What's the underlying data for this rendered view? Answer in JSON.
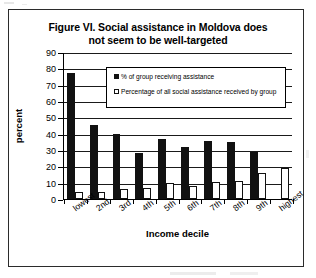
{
  "chart_data": {
    "type": "bar",
    "title": "Figure VI. Social assistance in Moldova does not seem to be well-targeted",
    "title_line1": "Figure VI. Social assistance in Moldova does",
    "title_line2": "not seem to be well-targeted",
    "xlabel": "Income decile",
    "ylabel": "percent",
    "ylim": [
      0,
      90
    ],
    "ytick_step": 10,
    "yticks": [
      0,
      10,
      20,
      30,
      40,
      50,
      60,
      70,
      80,
      90
    ],
    "grid": true,
    "legend_position": "inside-upper-center",
    "categories": [
      "lowest",
      "2nd",
      "3rd",
      "4th",
      "5th",
      "6th",
      "7th",
      "8th",
      "9th",
      "highest"
    ],
    "series": [
      {
        "name": "% of group receiving assistance",
        "color": "#111111",
        "fill": "solid",
        "values": [
          77,
          45.5,
          40,
          28,
          36.5,
          32,
          35.5,
          35,
          29,
          0
        ]
      },
      {
        "name": "Percentage of all social assistance received by group",
        "color": "#ffffff",
        "fill": "outlined",
        "values": [
          4,
          4,
          6,
          7,
          10,
          8,
          10.5,
          11,
          16,
          19
        ]
      }
    ]
  },
  "colors": {
    "series_dark": "#111111",
    "series_light": "#ffffff",
    "axis": "#000000",
    "frame": "#2b2b2b",
    "background": "#ffffff"
  }
}
